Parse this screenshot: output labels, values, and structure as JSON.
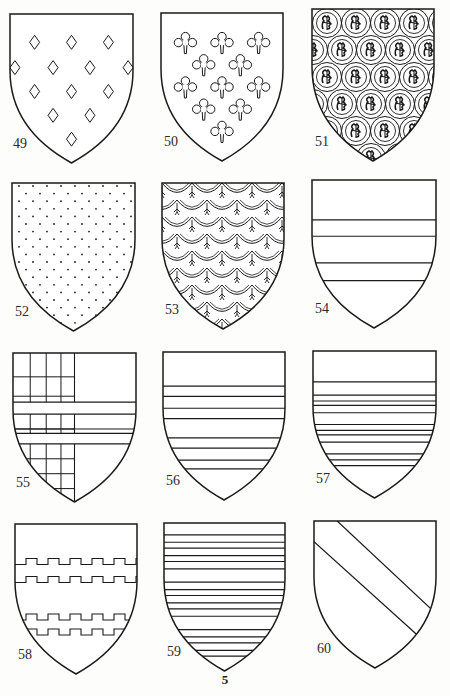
{
  "page": {
    "page_number": "5",
    "background": "#fdfdfb",
    "ink": "#1a1a1a"
  },
  "figures": [
    {
      "number": "49",
      "pattern": "lozenges-semy",
      "description": "Shield semy of lozenges (diamonds)",
      "box": [
        10,
        14,
        123,
        149
      ]
    },
    {
      "number": "50",
      "pattern": "quatrefoils-semy",
      "description": "Shield semy of four-petalled flowers (quatrefoils/cross-crosslets)",
      "box": [
        161,
        13,
        122,
        148
      ]
    },
    {
      "number": "51",
      "pattern": "roundels-charged",
      "description": "Shield covered with roundels, each charged with a lion or tree",
      "box": [
        312,
        9,
        122,
        152
      ]
    },
    {
      "number": "52",
      "pattern": "dots-powdered",
      "description": "Shield powdered with small dots",
      "box": [
        12,
        183,
        123,
        148
      ]
    },
    {
      "number": "53",
      "pattern": "scales-with-lilies",
      "description": "Shield of scalloped scales (papelonny) each with a small fleur",
      "box": [
        162,
        183,
        122,
        146
      ]
    },
    {
      "number": "54",
      "pattern": "bars-4-lines",
      "description": "Shield with horizontal bars (four lines)",
      "box": [
        312,
        180,
        124,
        148
      ]
    },
    {
      "number": "55",
      "pattern": "checky-sinister-with-bars",
      "description": "Shield with grid (checky) on dexter half, crossed by two bars",
      "box": [
        13,
        353,
        123,
        149
      ]
    },
    {
      "number": "56",
      "pattern": "barrulets-paired",
      "description": "Shield with paired horizontal barrulets",
      "box": [
        163,
        352,
        122,
        148
      ]
    },
    {
      "number": "57",
      "pattern": "barrulets-triple",
      "description": "Shield with many grouped horizontal lines",
      "box": [
        313,
        351,
        123,
        147
      ]
    },
    {
      "number": "58",
      "pattern": "bars-embattled",
      "description": "Shield with two embattled (crenellated) bars",
      "box": [
        15,
        524,
        122,
        150
      ]
    },
    {
      "number": "59",
      "pattern": "barry-many",
      "description": "Shield barry of many thin stripes",
      "box": [
        164,
        523,
        121,
        148
      ]
    },
    {
      "number": "60",
      "pattern": "bend",
      "description": "Shield with a bend (diagonal band)",
      "box": [
        314,
        521,
        122,
        147
      ]
    }
  ]
}
